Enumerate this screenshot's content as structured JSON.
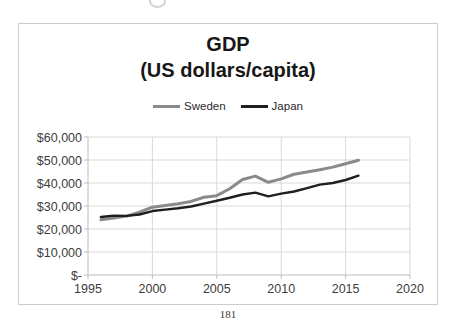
{
  "page": {
    "number": "181"
  },
  "chart_data": {
    "type": "line",
    "title": "GDP",
    "subtitle": "(US dollars/capita)",
    "x": [
      1996,
      1997,
      1998,
      1999,
      2000,
      2001,
      2002,
      2003,
      2004,
      2005,
      2006,
      2007,
      2008,
      2009,
      2010,
      2011,
      2012,
      2013,
      2014,
      2015,
      2016
    ],
    "series": [
      {
        "name": "Sweden",
        "color": "#8a8a8a",
        "values": [
          24000,
          24800,
          25600,
          27300,
          29500,
          30200,
          31000,
          32000,
          33800,
          34500,
          37500,
          41500,
          43000,
          40300,
          41800,
          43800,
          44800,
          45800,
          46900,
          48400,
          49900
        ]
      },
      {
        "name": "Japan",
        "color": "#1f1f1f",
        "values": [
          25200,
          25800,
          25700,
          26300,
          27800,
          28400,
          29000,
          29800,
          31000,
          32300,
          33600,
          35000,
          35800,
          34200,
          35400,
          36300,
          37800,
          39300,
          40000,
          41300,
          43200
        ]
      }
    ],
    "xlim": [
      1995,
      2020
    ],
    "ylim": [
      0,
      60000
    ],
    "x_ticks": [
      1995,
      2000,
      2005,
      2010,
      2015,
      2020
    ],
    "y_ticks": [
      {
        "value": 0,
        "label": "$-"
      },
      {
        "value": 10000,
        "label": "$10,000"
      },
      {
        "value": 20000,
        "label": "$20,000"
      },
      {
        "value": 30000,
        "label": "$30,000"
      },
      {
        "value": 40000,
        "label": "$40,000"
      },
      {
        "value": 50000,
        "label": "$50,000"
      },
      {
        "value": 60000,
        "label": "$60,000"
      }
    ],
    "grid": true,
    "legend_position": "top-center",
    "colors": {
      "gridline": "#d9d9d9",
      "axis": "#bdbdbd",
      "chart_border": "#cbcbcb"
    }
  }
}
